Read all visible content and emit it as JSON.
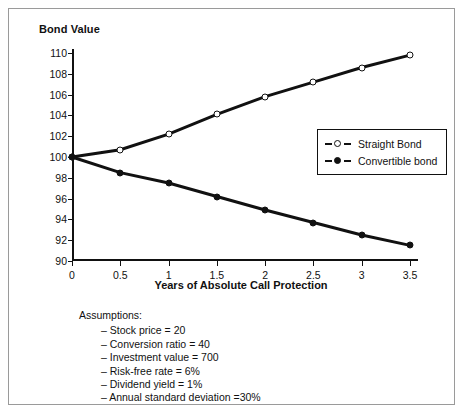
{
  "yaxis_title": "Bond Value",
  "xaxis_title": "Years of Absolute Call Protection",
  "legend": {
    "items": [
      {
        "label": "Straight Bond",
        "marker": "open-circle-marker"
      },
      {
        "label": "Convertible bond",
        "marker": "filled-circle-marker"
      }
    ]
  },
  "assumptions": {
    "heading": "Assumptions:",
    "items": [
      "– Stock price = 20",
      "– Conversion ratio = 40",
      "– Investment value = 700",
      "– Risk-free rate = 6%",
      "– Dividend yield = 1%",
      "– Annual standard deviation =30%"
    ]
  },
  "chart_data": {
    "type": "line",
    "title": "",
    "xlabel": "Years of Absolute Call Protection",
    "ylabel": "Bond Value",
    "x": [
      0,
      0.5,
      1,
      1.5,
      2,
      2.5,
      3,
      3.5
    ],
    "xlim": [
      0,
      3.5
    ],
    "ylim": [
      90,
      110
    ],
    "xticks": [
      "0",
      "0.5",
      "1",
      "1.5",
      "2",
      "2.5",
      "3",
      "3.5"
    ],
    "yticks": [
      "90",
      "92",
      "94",
      "96",
      "98",
      "100",
      "102",
      "104",
      "106",
      "108",
      "110"
    ],
    "grid": false,
    "legend_position": "center-right-inside",
    "series": [
      {
        "name": "Straight Bond",
        "marker": "open-circle",
        "color": "#111111",
        "values": [
          100,
          100.7,
          102.2,
          104.1,
          105.8,
          107.2,
          108.6,
          109.8
        ]
      },
      {
        "name": "Convertible bond",
        "marker": "filled-circle",
        "color": "#111111",
        "values": [
          100,
          98.5,
          97.5,
          96.2,
          94.9,
          93.7,
          92.5,
          91.5
        ]
      }
    ]
  }
}
